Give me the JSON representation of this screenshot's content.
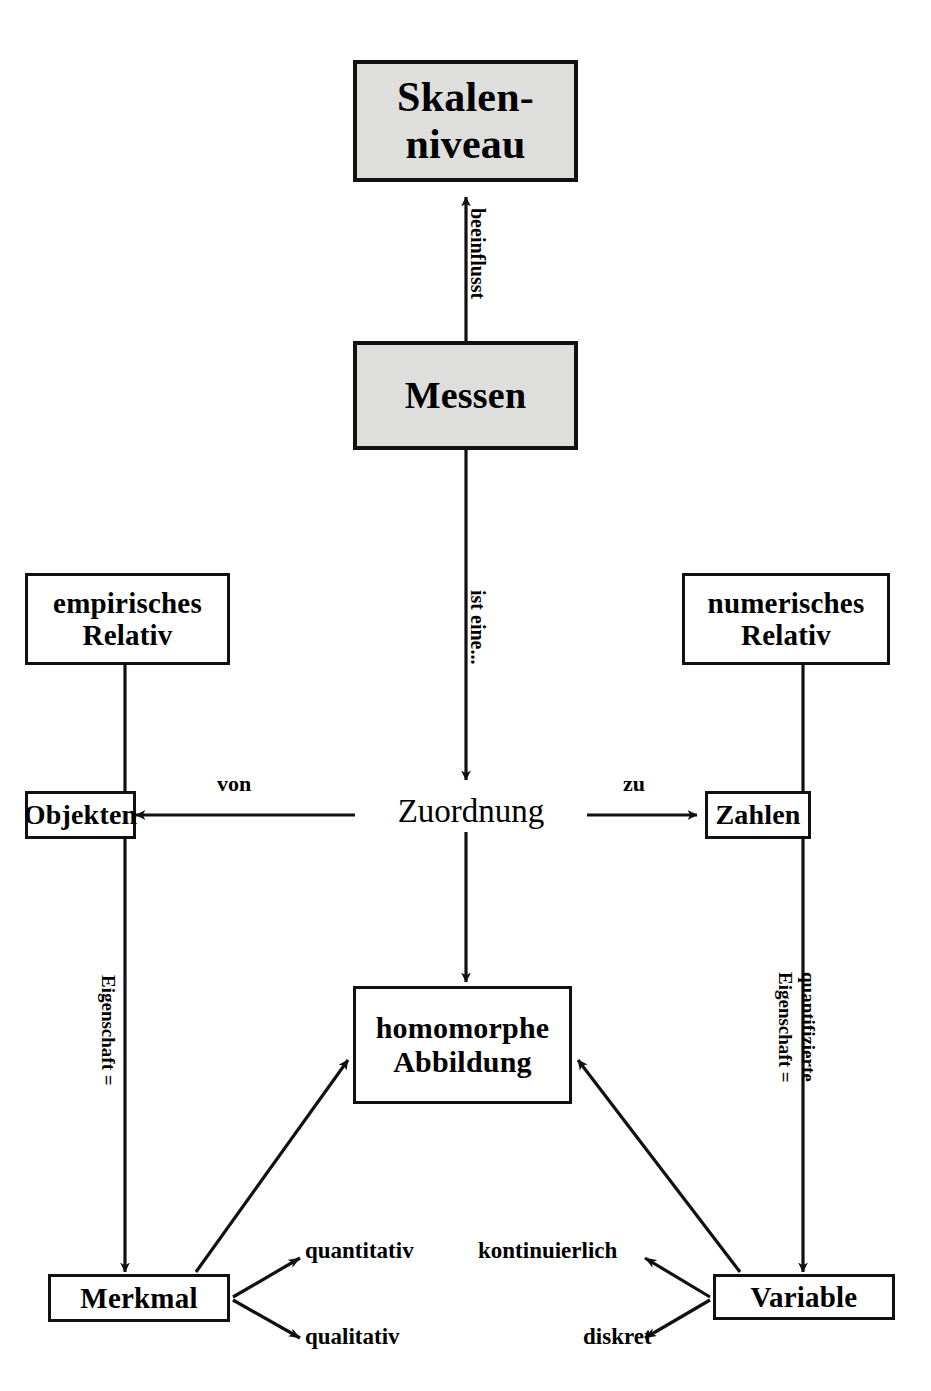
{
  "diagram": {
    "background_color": "#ffffff",
    "line_color": "#111111",
    "shaded_fill": "#dededc",
    "nodes": {
      "skalenniveau": "Skalen-\nniveau",
      "messen": "Messen",
      "empirisches_relativ": "empirisches\nRelativ",
      "numerisches_relativ": "numerisches\nRelativ",
      "objekten": "Objekten",
      "zuordnung": "Zuordnung",
      "zahlen": "Zahlen",
      "homomorphe_abbildung": "homomorphe\nAbbildung",
      "merkmal": "Merkmal",
      "variable": "Variable"
    },
    "leaves": {
      "quantitativ": "quantitativ",
      "qualitativ": "qualitativ",
      "kontinuierlich": "kontinuierlich",
      "diskret": "diskret"
    },
    "edge_labels": {
      "beeinflusst": "beeinflusst",
      "ist_eine": "ist eine...",
      "von": "von",
      "zu": "zu",
      "eigenschaft_links": "Eigenschaft =",
      "quantifizierte": "quantifizierte",
      "eigenschaft_rechts": "Eigenschaft ="
    }
  }
}
